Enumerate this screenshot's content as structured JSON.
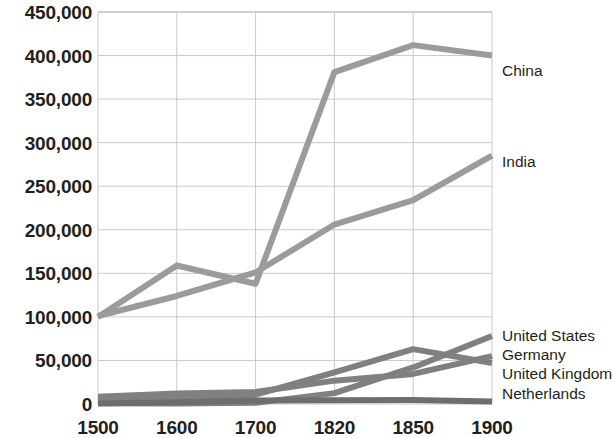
{
  "chart_data": {
    "type": "line",
    "title": "",
    "subtitle": "",
    "xlabel": "",
    "ylabel": "",
    "x": [
      "1500",
      "1600",
      "1700",
      "1820",
      "1850",
      "1900"
    ],
    "categories": [
      "1500",
      "1600",
      "1700",
      "1820",
      "1850",
      "1900"
    ],
    "ylim": [
      0,
      450000
    ],
    "ytick_values": [
      0,
      50000,
      100000,
      150000,
      200000,
      250000,
      300000,
      350000,
      400000,
      450000
    ],
    "ytick_labels": [
      "0",
      "50,000",
      "100,000",
      "150,000",
      "200,000",
      "250,000",
      "300,000",
      "350,000",
      "400,000",
      "450,000"
    ],
    "xtick_labels": [
      "1500",
      "1600",
      "1700",
      "1820",
      "1850",
      "1900"
    ],
    "grid": true,
    "legend_position": "line-end-labels",
    "series": [
      {
        "name": "China",
        "color": "#9b9b9b",
        "values": [
          100000,
          159000,
          138000,
          381000,
          412000,
          400000
        ]
      },
      {
        "name": "India",
        "color": "#9b9b9b",
        "values": [
          101000,
          124000,
          151000,
          206000,
          234000,
          285000
        ]
      },
      {
        "name": "United States",
        "color": "#808080",
        "values": [
          800,
          600,
          1300,
          12500,
          42000,
          78000
        ]
      },
      {
        "name": "Germany",
        "color": "#808080",
        "values": [
          8300,
          12000,
          13700,
          26800,
          34500,
          55000
        ]
      },
      {
        "name": "United Kingdom",
        "color": "#808080",
        "values": [
          2800,
          6000,
          10700,
          36200,
          63000,
          47000
        ]
      },
      {
        "name": "Netherlands",
        "color": "#6e6e6e",
        "values": [
          700,
          2100,
          4000,
          4300,
          4500,
          3000
        ]
      }
    ]
  },
  "series_labels": [
    {
      "name": "China",
      "text": "China"
    },
    {
      "name": "India",
      "text": "India"
    },
    {
      "name": "United States",
      "text": "United States"
    },
    {
      "name": "Germany",
      "text": "Germany"
    },
    {
      "name": "United Kingdom",
      "text": "United Kingdom"
    },
    {
      "name": "Netherlands",
      "text": "Netherlands"
    }
  ],
  "colors": {
    "line_primary": "#9b9b9b",
    "line_secondary": "#808080",
    "grid": "#c9c9c9",
    "text": "#231f20",
    "background": "#ffffff"
  }
}
